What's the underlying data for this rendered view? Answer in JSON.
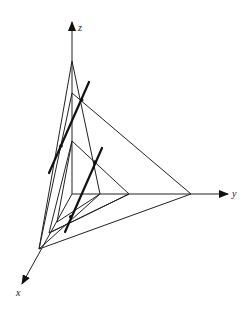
{
  "diagram": {
    "axes": {
      "z": {
        "label": "z",
        "origin": [
          72,
          194
        ],
        "tip": [
          72,
          22
        ],
        "label_pos": [
          78,
          31
        ]
      },
      "y": {
        "label": "y",
        "origin": [
          72,
          194
        ],
        "tip": [
          228,
          194
        ],
        "label_pos": [
          232,
          197
        ]
      },
      "x": {
        "label": "x",
        "origin": [
          72,
          194
        ],
        "tip": [
          22,
          284
        ],
        "label_pos": [
          16,
          296
        ]
      }
    },
    "planes": [
      {
        "name": "plane-1",
        "z_vertex": [
          72,
          61
        ],
        "x_vertex": [
          39,
          249
        ],
        "y_vertex": [
          100,
          194
        ]
      },
      {
        "name": "plane-2",
        "z_vertex": [
          72,
          93
        ],
        "x_vertex": [
          39,
          249
        ],
        "y_vertex": [
          191,
          194
        ]
      },
      {
        "name": "plane-3",
        "z_vertex": [
          72,
          141
        ],
        "x_vertex": [
          49,
          233
        ],
        "y_vertex": [
          129,
          194
        ]
      }
    ],
    "extra_edges": [
      {
        "from": [
          72,
          141
        ],
        "to": [
          57,
          222
        ]
      },
      {
        "from": [
          57,
          222
        ],
        "to": [
          100,
          194
        ]
      },
      {
        "from": [
          49,
          233
        ],
        "to": [
          129,
          194
        ]
      }
    ],
    "intersection_lines": [
      {
        "name": "intersection-line-1",
        "from": [
          89,
          82
        ],
        "to": [
          49,
          173
        ],
        "points": [
          [
            81.7,
            100
          ],
          [
            61,
            146
          ]
        ]
      },
      {
        "name": "intersection-line-2",
        "from": [
          102,
          148
        ],
        "to": [
          65,
          232
        ],
        "points": [
          [
            95,
            162
          ],
          [
            70.7,
            216.7
          ]
        ]
      }
    ]
  }
}
